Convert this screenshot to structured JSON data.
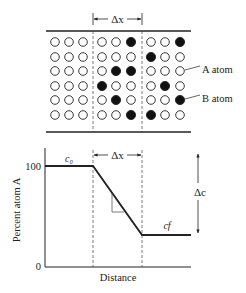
{
  "top_panel": {
    "delta_x_label": "Δx",
    "legend": {
      "a_atom_label": "A atom",
      "b_atom_label": "B atom"
    },
    "grid": {
      "rows": 6,
      "cols": 9,
      "filled": [
        [
          0,
          0,
          0,
          0,
          0,
          1,
          0,
          0,
          1
        ],
        [
          0,
          0,
          0,
          0,
          0,
          0,
          1,
          0,
          0
        ],
        [
          0,
          0,
          0,
          0,
          1,
          1,
          0,
          0,
          0
        ],
        [
          0,
          0,
          0,
          1,
          0,
          0,
          0,
          1,
          0
        ],
        [
          0,
          0,
          0,
          0,
          1,
          0,
          0,
          0,
          1
        ],
        [
          0,
          0,
          0,
          0,
          0,
          1,
          1,
          0,
          0
        ]
      ]
    }
  },
  "bottom_panel": {
    "y_axis_label": "Percent atom A",
    "x_axis_label": "Distance",
    "y_tick_100": "100",
    "y_tick_0": "0",
    "c0_label": "c₀",
    "cf_label": "cf",
    "delta_x_label": "Δx",
    "delta_c_label": "Δc"
  },
  "chart_data": {
    "type": "line",
    "title": "",
    "xlabel": "Distance",
    "ylabel": "Percent atom A",
    "ylim": [
      0,
      100
    ],
    "series": [
      {
        "name": "concentration profile",
        "points": [
          [
            0,
            100
          ],
          [
            1,
            100
          ],
          [
            2,
            30
          ],
          [
            3,
            30
          ]
        ]
      }
    ],
    "annotations": [
      "c0",
      "cf",
      "Δx",
      "Δc"
    ]
  },
  "colors": {
    "ink": "#222222",
    "background": "#ffffff"
  }
}
